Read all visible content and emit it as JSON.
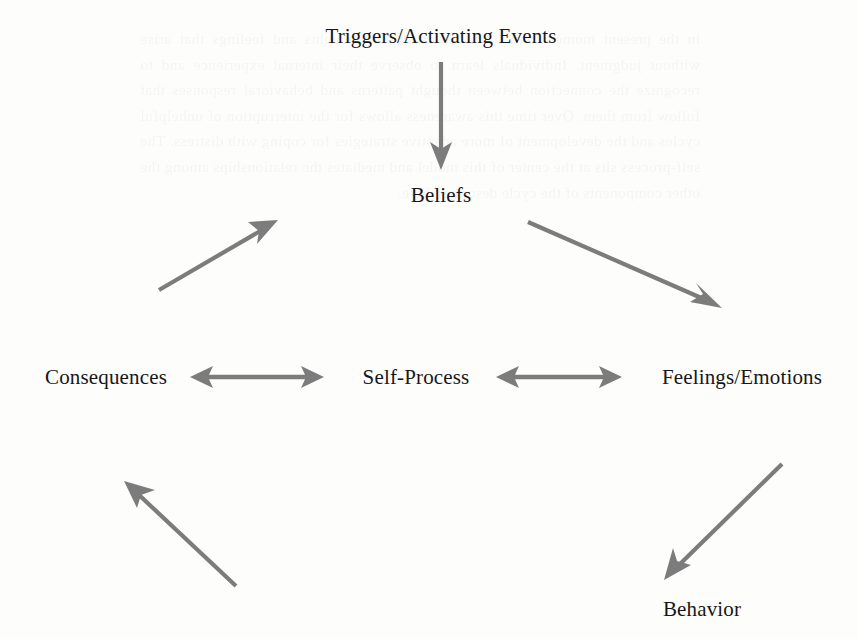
{
  "diagram": {
    "type": "cycle-flow-diagram",
    "background_color": "#fdfdfc",
    "arrow_color": "#7c7c7c",
    "text_color": "#171717",
    "nodes": [
      {
        "id": "triggers",
        "label": "Triggers/Activating Events",
        "x": 441,
        "y": 36
      },
      {
        "id": "beliefs",
        "label": "Beliefs",
        "x": 441,
        "y": 195
      },
      {
        "id": "feelings",
        "label": "Feelings/Emotions",
        "x": 742,
        "y": 377
      },
      {
        "id": "behavior",
        "label": "Behavior",
        "x": 702,
        "y": 609
      },
      {
        "id": "consequences",
        "label": "Consequences",
        "x": 106,
        "y": 377
      },
      {
        "id": "selfprocess",
        "label": "Self-Process",
        "x": 416,
        "y": 377
      }
    ],
    "edges": [
      {
        "id": "triggers-to-beliefs",
        "from": "triggers",
        "to": "beliefs",
        "style": "single-arrow",
        "direction": "down"
      },
      {
        "id": "beliefs-to-feelings",
        "from": "beliefs",
        "to": "feelings",
        "style": "single-arrow",
        "direction": "down-right"
      },
      {
        "id": "feelings-to-behavior",
        "from": "feelings",
        "to": "behavior",
        "style": "single-arrow",
        "direction": "down-left"
      },
      {
        "id": "behavior-to-consequences",
        "from": "behavior",
        "to": "consequences",
        "style": "single-arrow",
        "direction": "up-left"
      },
      {
        "id": "consequences-to-triggers",
        "from": "consequences",
        "to": "triggers",
        "style": "single-arrow",
        "direction": "up-right"
      },
      {
        "id": "consequences-selfprocess",
        "from": "consequences",
        "to": "selfprocess",
        "style": "double-arrow",
        "direction": "horizontal"
      },
      {
        "id": "selfprocess-feelings",
        "from": "selfprocess",
        "to": "feelings",
        "style": "double-arrow",
        "direction": "horizontal"
      }
    ]
  },
  "background_bleed": {
    "note": "faint mirrored show-through text from reverse side of scanned page",
    "text": "in the present moment and to be aware of the thoughts and feelings that arise without judgment. Individuals learn to observe their internal experience and to recognize the connection between thought patterns and behavioral responses that follow from them. Over time this awareness allows for the interruption of unhelpful cycles and the development of more adaptive strategies for coping with distress. The self-process sits at the center of this model and mediates the relationships among the other components of the cycle described here."
  }
}
